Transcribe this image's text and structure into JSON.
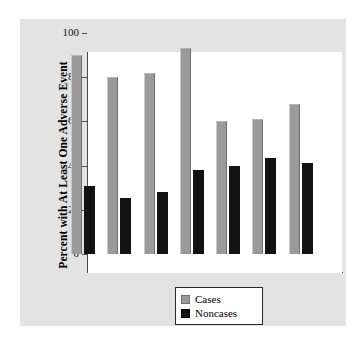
{
  "chart_data": {
    "type": "bar",
    "title": "",
    "xlabel": "",
    "ylabel": "Percent with At Least One Adverse Event",
    "ylim": [
      0,
      100
    ],
    "yticks": [
      0,
      20,
      40,
      60,
      80,
      100
    ],
    "grid": false,
    "legend_position": "bottom-center",
    "categories": [
      "1",
      "2",
      "3",
      "4",
      "5",
      "6",
      "7"
    ],
    "series": [
      {
        "name": "Cases",
        "color": "#9a9a9a",
        "values": [
          90,
          80,
          82,
          93,
          60,
          61,
          68
        ]
      },
      {
        "name": "Noncases",
        "color": "#121212",
        "values": [
          31,
          25.5,
          28,
          38,
          40,
          43.5,
          41
        ]
      }
    ]
  },
  "axis": {
    "y_title": "Percent with At Least One Adverse Event",
    "tick_labels": [
      "0",
      "20",
      "40",
      "60",
      "80",
      "100"
    ]
  },
  "legend": {
    "items": [
      {
        "label": "Cases",
        "color": "#9a9a9a"
      },
      {
        "label": "Noncases",
        "color": "#121212"
      }
    ]
  },
  "colors": {
    "page_background": "#ffffff",
    "panel_background": "#e3e3e3",
    "plot_background": "#ffffff",
    "axis": "#4a4a4a",
    "cases": "#9a9a9a",
    "noncases": "#121212"
  }
}
